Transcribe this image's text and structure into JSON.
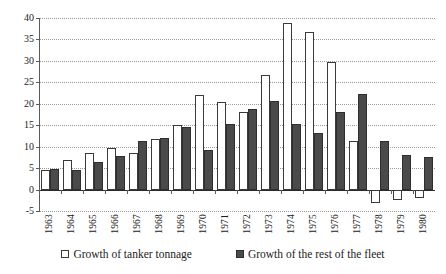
{
  "chart_data": {
    "type": "bar",
    "title": "",
    "subtitle": "",
    "xlabel": "",
    "ylabel": "",
    "ylim": [
      -5,
      40
    ],
    "ytick_step": 5,
    "yticks": [
      40,
      35,
      30,
      25,
      20,
      15,
      10,
      5,
      0,
      -5
    ],
    "ytick_labels": [
      "40",
      "35",
      "30",
      "25",
      "20",
      "15",
      "10",
      "5",
      "0",
      "-5"
    ],
    "grid": "horizontal-dotted",
    "legend_position": "bottom",
    "categories": [
      "1963",
      "1964",
      "1965",
      "1966",
      "1967",
      "1968",
      "1969",
      "1970",
      "1971",
      "1972",
      "1973",
      "1974",
      "1975",
      "1976",
      "1977",
      "1978",
      "1979",
      "1980"
    ],
    "series": [
      {
        "name": "Growth of tanker tonnage",
        "color": "#ffffff",
        "edge_color": "#3a3a3a",
        "values": [
          4.5,
          6.8,
          8.5,
          9.6,
          8.6,
          11.9,
          15.1,
          22.0,
          20.3,
          18.0,
          26.7,
          38.8,
          36.7,
          29.8,
          11.4,
          -3.2,
          -2.4,
          -1.9
        ]
      },
      {
        "name": "Growth of the rest of the fleet",
        "color": "#4a4a4a",
        "edge_color": "#2e2e2e",
        "values": [
          4.9,
          4.5,
          6.5,
          7.9,
          11.3,
          12.1,
          14.6,
          9.2,
          15.4,
          18.7,
          20.7,
          15.4,
          13.3,
          18.1,
          22.2,
          11.4,
          8.0,
          7.5
        ]
      }
    ]
  },
  "legend": {
    "items": [
      {
        "label": "Growth of tanker tonnage",
        "swatch": "light-square-icon"
      },
      {
        "label": "Growth of the rest of the fleet",
        "swatch": "dark-square-icon"
      }
    ]
  }
}
